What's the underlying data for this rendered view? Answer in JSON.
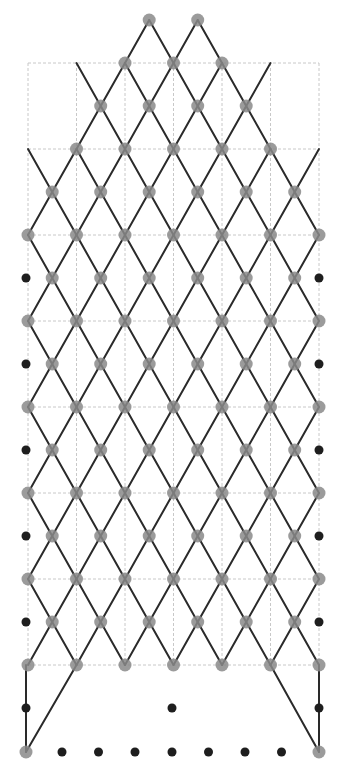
{
  "diagram": {
    "width": 349,
    "height": 769,
    "colors": {
      "grid": "#c8c8c8",
      "line": "#2a2a2a",
      "grey_node": "#8a8a8a",
      "black_node": "#1e1e1e"
    },
    "grid": {
      "x_lines": [
        28,
        76.5,
        125,
        173.5,
        222,
        270.5,
        319
      ],
      "y_lines": [
        63,
        149,
        235,
        321,
        407,
        493,
        579,
        665
      ],
      "top_segments": [
        [
          76.5,
          319
        ]
      ],
      "top_y": 63,
      "upper_left_top": 149
    },
    "full_cols": [
      28,
      76.5,
      125,
      173.5,
      222,
      270.5,
      319
    ],
    "mid_cols": [
      52.2,
      100.7,
      149.2,
      197.7,
      246.2,
      294.7
    ],
    "rows": [
      {
        "y": 20,
        "grey": [
          149.2,
          197.7
        ],
        "pts": [
          149.2,
          197.7
        ]
      },
      {
        "y": 63,
        "grey": [
          125,
          173.5,
          222
        ],
        "pts": [
          76.5,
          125,
          173.5,
          222,
          270.5
        ]
      },
      {
        "y": 106,
        "grey": [
          100.7,
          149.2,
          197.7,
          246.2
        ],
        "pts": [
          100.7,
          149.2,
          197.7,
          246.2
        ]
      },
      {
        "y": 149,
        "grey": [
          76.5,
          125,
          173.5,
          222,
          270.5
        ],
        "pts": [
          28,
          76.5,
          125,
          173.5,
          222,
          270.5,
          319
        ]
      },
      {
        "y": 192,
        "grey": [
          52.2,
          100.7,
          149.2,
          197.7,
          246.2,
          294.7
        ],
        "pts": [
          52.2,
          100.7,
          149.2,
          197.7,
          246.2,
          294.7
        ]
      },
      {
        "y": 235,
        "grey": [
          28,
          76.5,
          125,
          173.5,
          222,
          270.5,
          319
        ],
        "pts": [
          28,
          76.5,
          125,
          173.5,
          222,
          270.5,
          319
        ]
      },
      {
        "y": 278,
        "grey": [
          52.2,
          100.7,
          149.2,
          197.7,
          246.2,
          294.7
        ],
        "black": [
          26,
          319
        ],
        "pts": [
          52.2,
          100.7,
          149.2,
          197.7,
          246.2,
          294.7
        ]
      },
      {
        "y": 321,
        "grey": [
          28,
          76.5,
          125,
          173.5,
          222,
          270.5,
          319
        ],
        "pts": [
          28,
          76.5,
          125,
          173.5,
          222,
          270.5,
          319
        ]
      },
      {
        "y": 364,
        "grey": [
          52.2,
          100.7,
          149.2,
          197.7,
          246.2,
          294.7
        ],
        "black": [
          26,
          319
        ],
        "pts": [
          52.2,
          100.7,
          149.2,
          197.7,
          246.2,
          294.7
        ]
      },
      {
        "y": 407,
        "grey": [
          28,
          76.5,
          125,
          173.5,
          222,
          270.5,
          319
        ],
        "pts": [
          28,
          76.5,
          125,
          173.5,
          222,
          270.5,
          319
        ]
      },
      {
        "y": 450,
        "grey": [
          52.2,
          100.7,
          149.2,
          197.7,
          246.2,
          294.7
        ],
        "black": [
          26,
          319
        ],
        "pts": [
          52.2,
          100.7,
          149.2,
          197.7,
          246.2,
          294.7
        ]
      },
      {
        "y": 493,
        "grey": [
          28,
          76.5,
          125,
          173.5,
          222,
          270.5,
          319
        ],
        "pts": [
          28,
          76.5,
          125,
          173.5,
          222,
          270.5,
          319
        ]
      },
      {
        "y": 536,
        "grey": [
          52.2,
          100.7,
          149.2,
          197.7,
          246.2,
          294.7
        ],
        "black": [
          26,
          319
        ],
        "pts": [
          52.2,
          100.7,
          149.2,
          197.7,
          246.2,
          294.7
        ]
      },
      {
        "y": 579,
        "grey": [
          28,
          76.5,
          125,
          173.5,
          222,
          270.5,
          319
        ],
        "pts": [
          28,
          76.5,
          125,
          173.5,
          222,
          270.5,
          319
        ]
      },
      {
        "y": 622,
        "grey": [
          52.2,
          100.7,
          149.2,
          197.7,
          246.2,
          294.7
        ],
        "black": [
          26,
          319
        ],
        "pts": [
          52.2,
          100.7,
          149.2,
          197.7,
          246.2,
          294.7
        ]
      },
      {
        "y": 665,
        "grey": [
          28,
          76.5,
          125,
          173.5,
          222,
          270.5,
          319
        ],
        "pts": [
          28,
          76.5,
          125,
          173.5,
          222,
          270.5,
          319
        ]
      },
      {
        "y": 708,
        "black": [
          26,
          172,
          319
        ],
        "pts": []
      },
      {
        "y": 752,
        "grey": [
          26,
          319
        ],
        "black": [
          62,
          98.5,
          135,
          172,
          208.5,
          245,
          281.5
        ],
        "pts": []
      }
    ],
    "extra_lines": [
      [
        26,
        665,
        26,
        752
      ],
      [
        319,
        665,
        319,
        752
      ],
      [
        76.5,
        665,
        26,
        752
      ],
      [
        270.5,
        665,
        319,
        752
      ]
    ],
    "node_radius": {
      "grey": 6.5,
      "black": 4.5
    }
  }
}
